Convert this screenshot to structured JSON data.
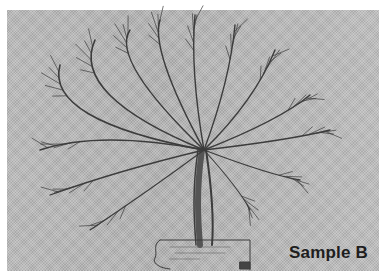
{
  "figure": {
    "caption": "Sample B",
    "colors": {
      "background": "#b4b4b4",
      "ink": "#3c3c3c",
      "caption": "#1e1e1e"
    }
  }
}
